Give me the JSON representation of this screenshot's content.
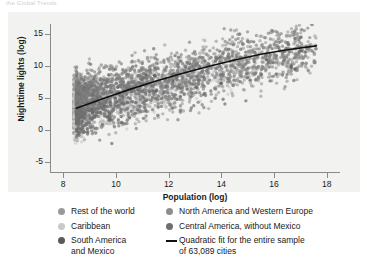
{
  "caption_remnant": "the Global Trends",
  "chart_data": {
    "type": "scatter",
    "title": "",
    "xlabel": "Population (log)",
    "ylabel": "Nighttime lights (log)",
    "xlim": [
      7.5,
      18.5
    ],
    "ylim": [
      -6.5,
      16.5
    ],
    "xticks": [
      8,
      10,
      12,
      14,
      16,
      18
    ],
    "yticks": [
      15,
      10,
      5,
      0,
      -5
    ],
    "xtick_labels": [
      "8",
      "10",
      "12",
      "14",
      "16",
      "18"
    ],
    "ytick_labels": [
      "15",
      "10",
      "5",
      "0",
      "-5"
    ],
    "grid": false,
    "legend_position": "below",
    "n_points_label": "63,089 cities",
    "series": [
      {
        "name": "Rest of the world",
        "color": "#9a9a9a",
        "marker": "circle",
        "approx_n": 1400,
        "x_range": [
          8.4,
          17.6
        ],
        "y_center_at_x": {
          "8.5": 4.0,
          "11": 6.5,
          "14": 9.5,
          "17": 12.3
        },
        "y_spread": 3.2
      },
      {
        "name": "Caribbean",
        "color": "#c9c9c9",
        "marker": "circle",
        "approx_n": 260,
        "x_range": [
          8.4,
          14.5
        ],
        "y_center_at_x": {
          "8.5": 2.6,
          "11": 5.4,
          "14": 8.4
        },
        "y_spread": 3.0
      },
      {
        "name": "South America and Mexico",
        "color": "#5a5a5a",
        "marker": "circle",
        "approx_n": 420,
        "x_range": [
          8.5,
          17.2
        ],
        "y_center_at_x": {
          "8.5": 3.4,
          "11": 6.2,
          "14": 9.4,
          "17": 12.4
        },
        "y_spread": 3.1
      },
      {
        "name": "North America and Western Europe",
        "color": "#7d7d7d",
        "marker": "circle",
        "approx_n": 900,
        "x_range": [
          8.5,
          17.6
        ],
        "y_center_at_x": {
          "8.5": 5.0,
          "11": 7.6,
          "14": 10.4,
          "17": 12.8
        },
        "y_spread": 2.6
      },
      {
        "name": "Central America, without Mexico",
        "color": "#6e6e6e",
        "marker": "circle",
        "approx_n": 220,
        "x_range": [
          8.5,
          13.5
        ],
        "y_center_at_x": {
          "8.5": 2.2,
          "11": 5.0,
          "13": 7.2
        },
        "y_spread": 2.8
      }
    ],
    "fit": {
      "name": "Quadratic fit for the entire sample of 63,089 cities",
      "type": "quadratic",
      "color": "#111111",
      "x_start": 8.5,
      "x_end": 17.6,
      "points": [
        {
          "x": 8.5,
          "y": 3.4
        },
        {
          "x": 9.5,
          "y": 4.9
        },
        {
          "x": 10.5,
          "y": 6.3
        },
        {
          "x": 11.5,
          "y": 7.6
        },
        {
          "x": 12.5,
          "y": 8.8
        },
        {
          "x": 13.5,
          "y": 9.9
        },
        {
          "x": 14.5,
          "y": 10.9
        },
        {
          "x": 15.5,
          "y": 11.8
        },
        {
          "x": 16.5,
          "y": 12.5
        },
        {
          "x": 17.6,
          "y": 13.1
        }
      ]
    }
  },
  "legend": {
    "left_items": [
      {
        "label": "Rest of the world",
        "color": "#9a9a9a",
        "marker": "dot"
      },
      {
        "label": "Caribbean",
        "color": "#c9c9c9",
        "marker": "dot"
      },
      {
        "label": "South America",
        "label2": "and Mexico",
        "color": "#5a5a5a",
        "marker": "dot"
      }
    ],
    "right_items": [
      {
        "label": "North America and Western Europe",
        "color": "#8e8e8e",
        "marker": "dot"
      },
      {
        "label": "Central America, without Mexico",
        "color": "#6e6e6e",
        "marker": "dot"
      },
      {
        "label": "Quadratic fit for the entire sample",
        "label2": "of 63,089 cities",
        "color": "#111111",
        "marker": "line"
      }
    ]
  },
  "colors": {
    "panel_bg": "#f2f2f0",
    "axis": "#8a8a8a",
    "text": "#1a1a1a",
    "fit_line": "#111111"
  }
}
